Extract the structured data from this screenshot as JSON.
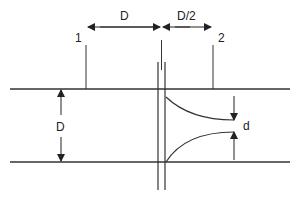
{
  "diagram": {
    "labels": {
      "top_dimension_upstream": "D",
      "top_dimension_downstream": "D/2",
      "station_1": "1",
      "station_2": "2",
      "pipe_diameter": "D",
      "vena_contracta_diameter": "d"
    },
    "colors": {
      "line": "#333333",
      "background": "#ffffff"
    }
  }
}
